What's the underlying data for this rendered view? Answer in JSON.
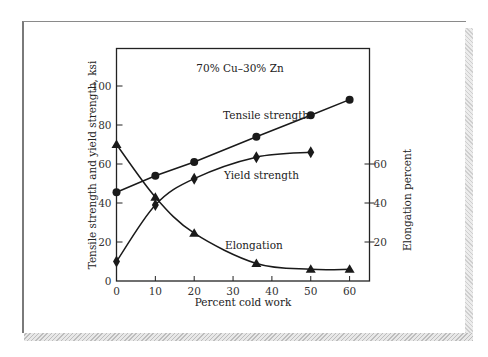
{
  "chart_data": {
    "type": "line",
    "title": "70% Cu–30% Zn",
    "xlabel": "Percent cold work",
    "ylabel": "Tensile strength and yield strength, ksi",
    "y2label": "Elongation percent",
    "xlim": [
      0,
      65
    ],
    "ylim": [
      0,
      120
    ],
    "y2lim": [
      0,
      120
    ],
    "x_ticks": [
      0,
      10,
      20,
      30,
      40,
      50,
      60
    ],
    "y_ticks": [
      0,
      20,
      40,
      60,
      80,
      100
    ],
    "y2_ticks": [
      20,
      40,
      60
    ],
    "grid": false,
    "legend": "inline labels",
    "series": [
      {
        "name": "Tensile strength",
        "axis": "left",
        "marker": "circle",
        "x": [
          0,
          10,
          20,
          36,
          50,
          60
        ],
        "values": [
          45.5,
          54,
          61,
          74,
          85,
          93
        ]
      },
      {
        "name": "Yield strength",
        "axis": "left",
        "marker": "diamond",
        "x": [
          0,
          10,
          20,
          36,
          50
        ],
        "values": [
          10,
          39,
          52.5,
          63.5,
          66
        ]
      },
      {
        "name": "Elongation",
        "axis": "right",
        "marker": "triangle",
        "x": [
          0,
          10,
          20,
          36,
          50,
          60
        ],
        "values": [
          70,
          43,
          24.5,
          9,
          6,
          6
        ]
      }
    ]
  },
  "labels": {
    "annotation": "70% Cu–30% Zn",
    "tensile": "Tensile strength",
    "yield": "Yield strength",
    "elongation": "Elongation",
    "xlabel": "Percent cold work",
    "ylabel": "Tensile strength and yield strength, ksi",
    "y2label": "Elongation percent"
  }
}
